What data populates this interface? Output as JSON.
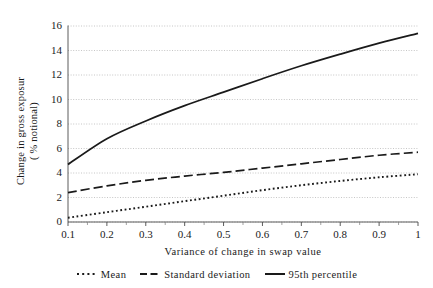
{
  "chart_data": {
    "type": "line",
    "title": "",
    "xlabel": "Variance of change in swap value",
    "ylabel": "Change in gross exposur\n( % notional)",
    "xlim": [
      0.1,
      1.0
    ],
    "ylim": [
      0,
      16
    ],
    "grid": true,
    "grid_axis": "y",
    "grid_style": "dotted",
    "legend_position": "bottom",
    "x": [
      0.1,
      0.2,
      0.3,
      0.4,
      0.5,
      0.6,
      0.7,
      0.8,
      0.9,
      1.0
    ],
    "xticklabels": [
      "0.1",
      "0.2",
      "0.3",
      "0.4",
      "0.5",
      "0.6",
      "0.7",
      "0.8",
      "0.9",
      "1"
    ],
    "yticks": [
      0,
      2,
      4,
      6,
      8,
      10,
      12,
      14,
      16
    ],
    "yticklabels": [
      "0",
      "2",
      "4",
      "6",
      "8",
      "10",
      "12",
      "14",
      "16"
    ],
    "series": [
      {
        "name": "Mean",
        "style": "dotted",
        "color": "#1a1a1a",
        "values": [
          0.35,
          0.8,
          1.25,
          1.7,
          2.15,
          2.6,
          3.0,
          3.35,
          3.65,
          3.9
        ]
      },
      {
        "name": "Standard deviation",
        "style": "dashed",
        "color": "#1a1a1a",
        "values": [
          2.4,
          2.95,
          3.4,
          3.75,
          4.05,
          4.4,
          4.75,
          5.1,
          5.45,
          5.7
        ]
      },
      {
        "name": "95th percentile",
        "style": "solid",
        "color": "#1a1a1a",
        "values": [
          4.7,
          6.8,
          8.25,
          9.5,
          10.6,
          11.7,
          12.75,
          13.7,
          14.6,
          15.4
        ]
      }
    ]
  },
  "axes": {
    "x_title": "Variance of change in swap value",
    "y_title_line1": "Change in gross exposur",
    "y_title_line2": "( % notional)"
  },
  "legend": {
    "items": [
      {
        "label": "Mean",
        "style": "dotted"
      },
      {
        "label": "Standard deviation",
        "style": "dashed"
      },
      {
        "label": "95th percentile",
        "style": "solid"
      }
    ]
  }
}
